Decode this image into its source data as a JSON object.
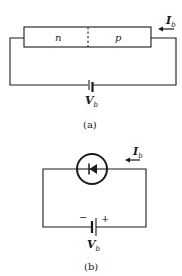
{
  "figure_a": {
    "region_n_label": "n",
    "region_p_label": "p",
    "current_label": "I",
    "current_subscript": "b",
    "voltage_label": "V",
    "voltage_subscript": "b",
    "caption": "(a)"
  },
  "figure_b": {
    "current_label": "I",
    "current_subscript": "b",
    "voltage_label": "V",
    "voltage_subscript": "b",
    "minus_label": "−",
    "plus_label": "+",
    "caption": "(b)"
  },
  "colors": {
    "ink": "#1a1a1a",
    "background": "#ffffff"
  }
}
